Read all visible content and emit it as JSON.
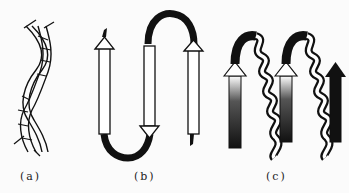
{
  "figure": {
    "panels": [
      {
        "id": "a",
        "label": "(a)",
        "depicts": "coiled-coil (two intertwined helices)"
      },
      {
        "id": "b",
        "label": "(b)",
        "depicts": "beta-meander (three antiparallel strands connected by loops)"
      },
      {
        "id": "c",
        "label": "(c)",
        "depicts": "beta-alpha-beta-alpha-beta motif (strands with helical connections)"
      }
    ],
    "colors": {
      "ink": "#111111",
      "background": "#fbfbfb",
      "fill": "#ffffff"
    }
  }
}
